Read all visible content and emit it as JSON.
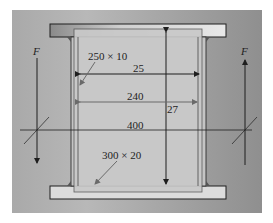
{
  "diagram": {
    "type": "welded plate girder cross-section / bracket elevation",
    "labels": {
      "web_plate": "250 × 10",
      "flange_plate": "300 × 20",
      "dim_top": "25",
      "dim_mid": "240",
      "dim_vertical": "27",
      "dim_centerline": "400",
      "force_left": "F",
      "force_right": "F"
    },
    "colors": {
      "background": "#a9a9a9",
      "plate_light": "#d0d0d0",
      "flange": "#c8c8c8",
      "line": "#1e1e1e",
      "leader": "#6a6a6a"
    }
  }
}
